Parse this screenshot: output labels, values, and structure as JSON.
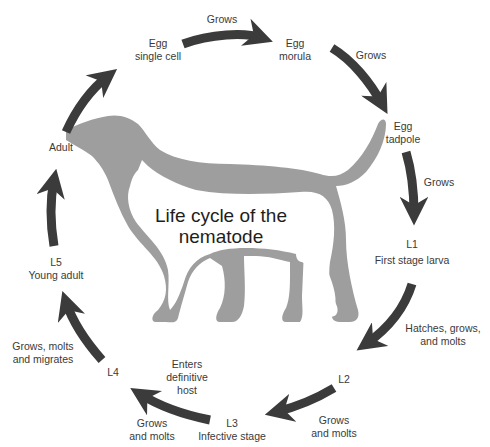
{
  "title": {
    "line1": "Life cycle of the",
    "line2": "nematode"
  },
  "colors": {
    "arrow": "#3b3b3b",
    "silhouette": "#9e9e9e",
    "background": "#ffffff",
    "text": "#333333"
  },
  "stages": [
    {
      "id": "egg-single",
      "line1": "Egg",
      "line2": "single cell"
    },
    {
      "id": "egg-morula",
      "line1": "Egg",
      "line2": "morula"
    },
    {
      "id": "egg-tadpole",
      "line1": "Egg",
      "line2": "tadpole"
    },
    {
      "id": "l1",
      "line1": "L1",
      "line2": "First stage larva"
    },
    {
      "id": "l2",
      "line1": "L2"
    },
    {
      "id": "l3",
      "line1": "L3",
      "line2": "Infective stage"
    },
    {
      "id": "l4",
      "line1": "L4"
    },
    {
      "id": "l5",
      "line1": "L5",
      "line2": "Young adult"
    },
    {
      "id": "adult",
      "line1": "Adult"
    }
  ],
  "transitions": [
    {
      "from": "egg-single",
      "to": "egg-morula",
      "line1": "Grows"
    },
    {
      "from": "egg-morula",
      "to": "egg-tadpole",
      "line1": "Grows"
    },
    {
      "from": "egg-tadpole",
      "to": "l1",
      "line1": "Grows"
    },
    {
      "from": "l1",
      "to": "l2",
      "line1": "Hatches, grows,",
      "line2": "and molts"
    },
    {
      "from": "l2",
      "to": "l3",
      "line1": "Grows",
      "line2": "and molts"
    },
    {
      "from": "l3",
      "to": "l4",
      "line1": "Enters",
      "line2": "definitive",
      "line3": "host",
      "extra1": "Grows",
      "extra2": "and molts"
    },
    {
      "from": "l4",
      "to": "l5",
      "line1": "Grows, molts",
      "line2": "and migrates"
    },
    {
      "from": "l5",
      "to": "adult",
      "line1": ""
    },
    {
      "from": "adult",
      "to": "egg-single",
      "line1": ""
    }
  ]
}
